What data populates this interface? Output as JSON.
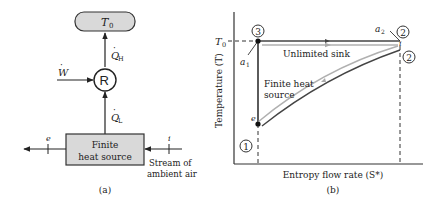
{
  "panel_a": {
    "caption": "(a)",
    "sink_box": {
      "label": "T",
      "subscript": "0",
      "fill": "#d9d9d9"
    },
    "refrigerator": {
      "label": "R"
    },
    "work_input": {
      "label": "W",
      "dot": "·"
    },
    "heat_high": {
      "label": "Q",
      "subscript": "H",
      "dot": "·"
    },
    "heat_low": {
      "label": "Q",
      "subscript": "L",
      "dot": "·"
    },
    "source_box": {
      "line1": "Finite",
      "line2": "heat source",
      "fill": "#d9d9d9"
    },
    "exit_state": {
      "label": "e"
    },
    "inlet_state": {
      "label": "i"
    },
    "stream_label": {
      "line1": "Stream of",
      "line2": "ambient air"
    }
  },
  "panel_b": {
    "caption": "(b)",
    "x_axis_label": "Entropy flow rate (S*)",
    "y_axis_label": "Temperature (T)",
    "t0_label": "T",
    "t0_subscript": "0",
    "states": [
      {
        "id": "1",
        "label": "1"
      },
      {
        "id": "2",
        "label": "2"
      },
      {
        "id": "2b",
        "label": "2"
      },
      {
        "id": "3",
        "label": "3"
      }
    ],
    "point_labels": {
      "a1": "a",
      "a1_sub": "1",
      "a2": "a",
      "a2_sub": "2",
      "e": "e",
      "i": "i"
    },
    "curve_labels": {
      "sink": "Unlimited sink",
      "source_line1": "Finite heat",
      "source_line2": "source"
    },
    "colors": {
      "cycle_line": "#333333",
      "stream_line": "#b0b0b0",
      "axis": "#333333"
    }
  }
}
